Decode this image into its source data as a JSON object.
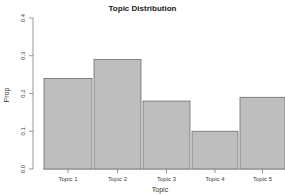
{
  "chart_data": {
    "type": "bar",
    "title": "Topic Distribution",
    "xlabel": "Topic",
    "ylabel": "Prop",
    "categories": [
      "Topic 1",
      "Topic 2",
      "Topic 3",
      "Topic 4",
      "Topic 5"
    ],
    "values": [
      0.24,
      0.29,
      0.18,
      0.1,
      0.19
    ],
    "ylim": [
      0.0,
      0.4
    ],
    "yticks": [
      0.0,
      0.1,
      0.2,
      0.3,
      0.4
    ],
    "ytick_labels": [
      "0.0",
      "0.1",
      "0.2",
      "0.3",
      "0.4"
    ],
    "grid": false,
    "legend": false,
    "bar_color": "#bebebe",
    "bar_border_color": "#6e6e6e",
    "axis_color": "#8a8a8a",
    "background": "#ffffff"
  }
}
